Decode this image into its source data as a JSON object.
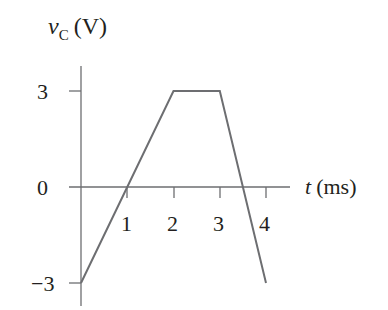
{
  "chart_data": {
    "type": "line",
    "title": "",
    "xlabel": "t (ms)",
    "ylabel": "v_C (V)",
    "ylabel_parts": {
      "var": "v",
      "sub": "C",
      "unit": "(V)"
    },
    "xlabel_parts": {
      "var": "t",
      "unit": "(ms)"
    },
    "x_ticks": [
      "1",
      "2",
      "3",
      "4"
    ],
    "y_ticks": [
      "3",
      "0",
      "−3"
    ],
    "xlim": [
      0,
      4
    ],
    "ylim": [
      -3,
      3
    ],
    "grid": false,
    "series": [
      {
        "name": "v_C",
        "x": [
          0,
          2,
          3,
          4
        ],
        "y": [
          -3,
          3,
          3,
          -3
        ],
        "color": "#6d6e71"
      }
    ]
  }
}
